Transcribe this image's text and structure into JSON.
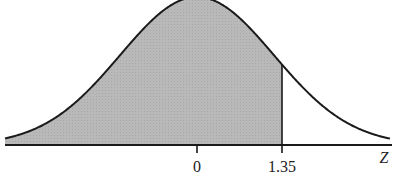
{
  "chart_data": {
    "type": "area",
    "title": "",
    "xlabel": "Z",
    "ylabel": "",
    "x_ticks": [
      {
        "value": 0,
        "label": "0"
      },
      {
        "value": 1.35,
        "label": "1.35"
      }
    ],
    "shaded_region": {
      "from": "-inf",
      "to": 1.35
    },
    "boundary_line_at": 1.35,
    "grid": false,
    "legend": null,
    "colors": {
      "shade": "#b4b4b4",
      "curve": "#1a1a1a",
      "axis": "#1a1a1a"
    }
  },
  "labels": {
    "tick_0": "0",
    "tick_135": "1.35",
    "axis_z": "Z"
  }
}
